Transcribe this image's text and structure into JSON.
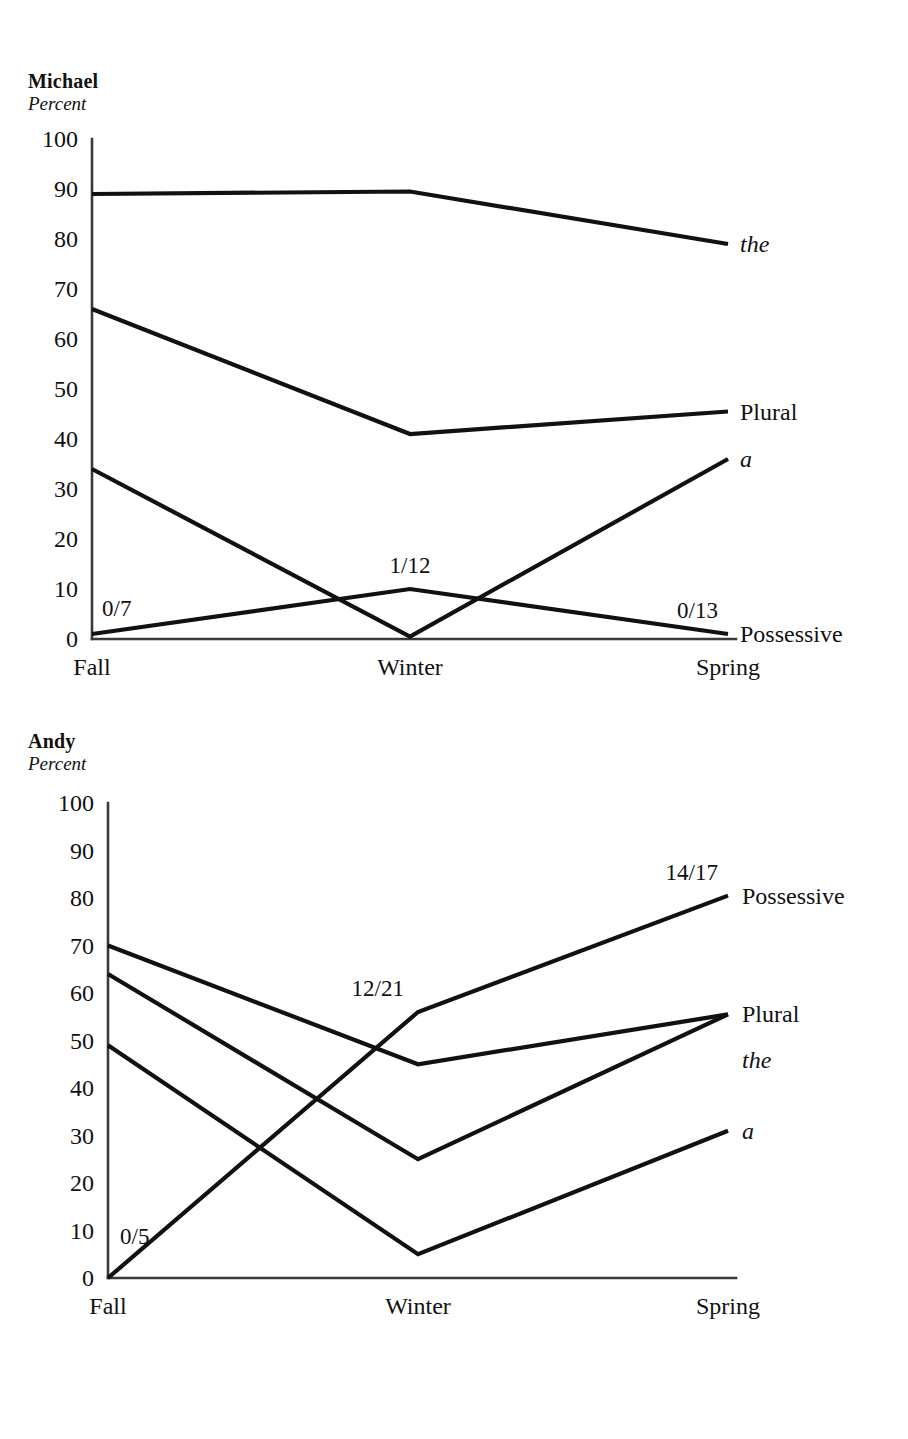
{
  "charts": [
    {
      "id": "michael",
      "title": "Michael",
      "subtitle": "Percent",
      "ylabel": "Percent",
      "xlabel": "",
      "categories": [
        "Fall",
        "Winter",
        "Spring"
      ],
      "yticks": [
        "100",
        "90",
        "80",
        "70",
        "60",
        "50",
        "40",
        "30",
        "20",
        "10",
        "0"
      ],
      "series": [
        {
          "name": "the",
          "label": "the",
          "style": "italic",
          "values": [
            89,
            89.5,
            79
          ]
        },
        {
          "name": "Plural",
          "label": "Plural",
          "style": "roman",
          "values": [
            66,
            41,
            45.5
          ]
        },
        {
          "name": "a",
          "label": "a",
          "style": "italic",
          "values": [
            34,
            0.5,
            36
          ]
        },
        {
          "name": "Possessive",
          "label": "Possessive",
          "style": "roman",
          "values": [
            1,
            10,
            1
          ]
        }
      ],
      "annotations": [
        {
          "text": "0/7",
          "series": "Possessive",
          "category": "Fall"
        },
        {
          "text": "1/12",
          "series": "Possessive",
          "category": "Winter"
        },
        {
          "text": "0/13",
          "series": "Possessive",
          "category": "Spring"
        }
      ]
    },
    {
      "id": "andy",
      "title": "Andy",
      "subtitle": "Percent",
      "ylabel": "Percent",
      "xlabel": "",
      "categories": [
        "Fall",
        "Winter",
        "Spring"
      ],
      "yticks": [
        "100",
        "90",
        "80",
        "70",
        "60",
        "50",
        "40",
        "30",
        "20",
        "10",
        "0"
      ],
      "series": [
        {
          "name": "Possessive",
          "label": "Possessive",
          "style": "roman",
          "values": [
            0,
            56,
            80.5
          ]
        },
        {
          "name": "Plural",
          "label": "Plural",
          "style": "roman",
          "values": [
            70,
            45,
            55.5
          ]
        },
        {
          "name": "the",
          "label": "the",
          "style": "italic",
          "values": [
            64,
            25,
            55.5
          ]
        },
        {
          "name": "a",
          "label": "a",
          "style": "italic",
          "values": [
            49,
            5,
            31
          ]
        }
      ],
      "annotations": [
        {
          "text": "0/5",
          "series": "Possessive",
          "category": "Fall"
        },
        {
          "text": "12/21",
          "series": "Possessive",
          "category": "Winter"
        },
        {
          "text": "14/17",
          "series": "Possessive",
          "category": "Spring"
        }
      ]
    }
  ],
  "chart_data": [
    {
      "type": "line",
      "title": "Michael",
      "subtitle": "Percent",
      "xlabel": "",
      "ylabel": "Percent",
      "categories": [
        "Fall",
        "Winter",
        "Spring"
      ],
      "ylim": [
        0,
        100
      ],
      "ytick_step": 10,
      "grid": false,
      "legend": "right-of-line-ends",
      "series": [
        {
          "name": "the",
          "values": [
            89,
            90,
            79
          ]
        },
        {
          "name": "Plural",
          "values": [
            66,
            41,
            45
          ]
        },
        {
          "name": "a",
          "values": [
            34,
            0,
            36
          ]
        },
        {
          "name": "Possessive",
          "values": [
            0,
            8,
            0
          ],
          "fractions": [
            "0/7",
            "1/12",
            "0/13"
          ]
        }
      ],
      "annotations": [
        "0/7",
        "1/12",
        "0/13"
      ]
    },
    {
      "type": "line",
      "title": "Andy",
      "subtitle": "Percent",
      "xlabel": "",
      "ylabel": "Percent",
      "categories": [
        "Fall",
        "Winter",
        "Spring"
      ],
      "ylim": [
        0,
        100
      ],
      "ytick_step": 10,
      "grid": false,
      "legend": "right-of-line-ends",
      "series": [
        {
          "name": "Possessive",
          "values": [
            0,
            57,
            82
          ],
          "fractions": [
            "0/5",
            "12/21",
            "14/17"
          ]
        },
        {
          "name": "Plural",
          "values": [
            70,
            45,
            55
          ]
        },
        {
          "name": "the",
          "values": [
            64,
            25,
            55
          ]
        },
        {
          "name": "a",
          "values": [
            49,
            5,
            31
          ]
        }
      ],
      "annotations": [
        "0/5",
        "12/21",
        "14/17"
      ]
    }
  ]
}
